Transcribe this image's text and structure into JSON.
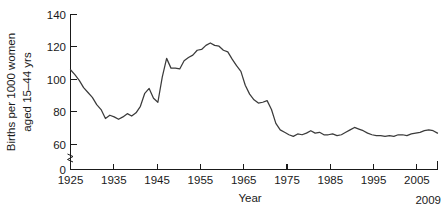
{
  "chart_data": {
    "type": "line",
    "title": "",
    "xlabel": "Year",
    "ylabel": "Births per 1000 women aged 15–44 yrs",
    "ylabel_line1": "Births per 1000 women",
    "ylabel_line2": "aged 15–44 yrs",
    "xlim": [
      1925,
      2009
    ],
    "ylim": [
      0,
      140
    ],
    "grid": false,
    "legend": "none",
    "axis_break": {
      "present": true,
      "axis": "y",
      "between": [
        0,
        60
      ],
      "symbol": "squiggle"
    },
    "yticks": [
      0,
      60,
      80,
      100,
      120,
      140
    ],
    "ytick_labels": [
      "0",
      "60",
      "80",
      "100",
      "120",
      "140"
    ],
    "xticks": [
      1925,
      1935,
      1945,
      1955,
      1965,
      1975,
      1985,
      1995,
      2005
    ],
    "xtick_labels": [
      "1925",
      "1935",
      "1945",
      "1955",
      "1965",
      "1975",
      "1985",
      "1995",
      "2005"
    ],
    "x_end_label": "2009",
    "line_color": "#3b3b3b",
    "series": [
      {
        "name": "General fertility rate",
        "x": [
          1925,
          1926,
          1927,
          1928,
          1929,
          1930,
          1931,
          1932,
          1933,
          1934,
          1935,
          1936,
          1937,
          1938,
          1939,
          1940,
          1941,
          1942,
          1943,
          1944,
          1945,
          1946,
          1947,
          1948,
          1949,
          1950,
          1951,
          1952,
          1953,
          1954,
          1955,
          1956,
          1957,
          1958,
          1959,
          1960,
          1961,
          1962,
          1963,
          1964,
          1965,
          1966,
          1967,
          1968,
          1969,
          1970,
          1971,
          1972,
          1973,
          1974,
          1975,
          1976,
          1977,
          1978,
          1979,
          1980,
          1981,
          1982,
          1983,
          1984,
          1985,
          1986,
          1987,
          1988,
          1989,
          1990,
          1991,
          1992,
          1993,
          1994,
          1995,
          1996,
          1997,
          1998,
          1999,
          2000,
          2001,
          2002,
          2003,
          2004,
          2005,
          2006,
          2007,
          2008,
          2009
        ],
        "values": [
          106.0,
          103.0,
          99.5,
          95.0,
          92.0,
          89.0,
          84.5,
          81.5,
          76.0,
          78.0,
          77.0,
          75.5,
          77.0,
          79.0,
          77.5,
          79.5,
          83.5,
          91.5,
          94.5,
          88.5,
          86.0,
          101.5,
          113.0,
          107.0,
          107.0,
          106.5,
          111.5,
          113.5,
          115.0,
          118.0,
          118.5,
          121.0,
          122.5,
          121.0,
          120.5,
          118.0,
          117.0,
          112.5,
          108.5,
          105.0,
          96.5,
          91.0,
          87.5,
          85.5,
          86.0,
          87.0,
          81.5,
          73.0,
          69.0,
          67.5,
          66.0,
          65.0,
          66.5,
          66.0,
          67.0,
          68.5,
          67.0,
          67.5,
          66.0,
          66.0,
          66.5,
          65.5,
          66.0,
          67.5,
          69.0,
          70.5,
          69.5,
          68.5,
          67.0,
          66.0,
          65.5,
          65.5,
          65.0,
          65.5,
          65.0,
          66.0,
          66.0,
          65.5,
          66.5,
          67.0,
          67.5,
          68.5,
          69.0,
          68.5,
          67.0
        ]
      }
    ]
  },
  "axis": {
    "y_title_line1": "Births per 1000 women",
    "y_title_line2": "aged 15–44 yrs",
    "x_title": "Year",
    "end_tick_label": "2009"
  }
}
